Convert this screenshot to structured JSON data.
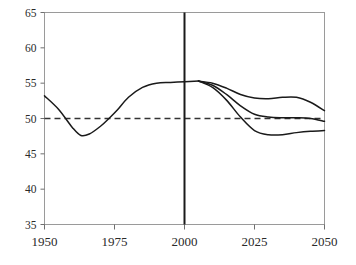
{
  "chart_data": {
    "type": "line",
    "title": "",
    "subtitle": "",
    "xlabel": "",
    "ylabel": "",
    "xlim": [
      1950,
      2050
    ],
    "ylim": [
      35,
      65
    ],
    "grid": false,
    "legend": false,
    "legend_position": "none",
    "x_ticks": [
      1950,
      1975,
      2000,
      2025,
      2050
    ],
    "x_tick_labels": [
      "1950",
      "1975",
      "2000",
      "2025",
      "2050"
    ],
    "y_ticks": [
      35,
      40,
      45,
      50,
      55,
      60,
      65
    ],
    "y_tick_labels": [
      "35",
      "40",
      "45",
      "50",
      "55",
      "60",
      "65"
    ],
    "annotations": {
      "reference_line": {
        "name": "fifty-percent-reference",
        "orientation": "horizontal",
        "value": 50,
        "style": "dashed",
        "color": "#333333"
      },
      "divider_line": {
        "name": "year-2000-divider",
        "orientation": "vertical",
        "value": 2000,
        "style": "solid",
        "color": "#1a1a1a"
      }
    },
    "series": [
      {
        "name": "Historical",
        "color": "#1a1a1a",
        "style": "solid",
        "x": [
          1950,
          1955,
          1960,
          1963,
          1966,
          1970,
          1973,
          1976,
          1980,
          1985,
          1990,
          1995,
          2000,
          2005
        ],
        "values": [
          53.2,
          51.3,
          48.7,
          47.6,
          47.8,
          48.9,
          50.0,
          51.2,
          53.0,
          54.4,
          55.0,
          55.1,
          55.2,
          55.3
        ]
      },
      {
        "name": "High projection",
        "color": "#1a1a1a",
        "style": "solid",
        "x": [
          2005,
          2010,
          2015,
          2020,
          2025,
          2030,
          2035,
          2040,
          2045,
          2050
        ],
        "values": [
          55.3,
          55.0,
          54.3,
          53.4,
          52.9,
          52.8,
          53.0,
          53.0,
          52.3,
          51.1
        ]
      },
      {
        "name": "Medium projection",
        "color": "#1a1a1a",
        "style": "solid",
        "x": [
          2005,
          2010,
          2015,
          2020,
          2025,
          2030,
          2035,
          2040,
          2045,
          2050
        ],
        "values": [
          55.3,
          54.7,
          53.4,
          51.8,
          50.6,
          50.2,
          50.1,
          50.1,
          50.0,
          49.6
        ]
      },
      {
        "name": "Low projection",
        "color": "#1a1a1a",
        "style": "solid",
        "x": [
          2005,
          2010,
          2015,
          2020,
          2025,
          2030,
          2035,
          2040,
          2045,
          2050
        ],
        "values": [
          55.3,
          54.4,
          52.6,
          50.2,
          48.3,
          47.7,
          47.7,
          48.0,
          48.2,
          48.3
        ]
      }
    ]
  }
}
